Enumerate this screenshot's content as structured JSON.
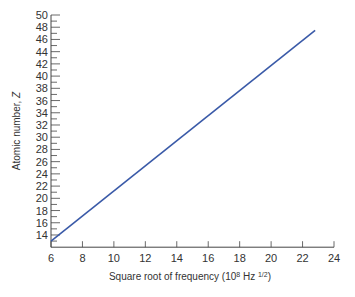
{
  "chart_data": {
    "type": "line",
    "title": "",
    "xlabel": "Square root of frequency (10^8 Hz^1/2)",
    "xlabel_parts": {
      "main": "Square root of frequency (10",
      "exp1": "8",
      "mid": " Hz ",
      "exp2": "1/2",
      "end": ")"
    },
    "ylabel": "Atomic number, Z",
    "xlim": [
      6,
      24
    ],
    "ylim": [
      12,
      50
    ],
    "x_ticks": [
      6,
      8,
      10,
      12,
      14,
      16,
      18,
      20,
      22,
      24
    ],
    "y_ticks": [
      14,
      16,
      18,
      20,
      22,
      24,
      26,
      28,
      30,
      32,
      34,
      36,
      38,
      40,
      42,
      44,
      46,
      48,
      50
    ],
    "grid": false,
    "legend": null,
    "series": [
      {
        "name": "Moseley line",
        "color": "#3a5aa8",
        "x": [
          6,
          22.8
        ],
        "y": [
          13,
          47.5
        ]
      }
    ]
  }
}
